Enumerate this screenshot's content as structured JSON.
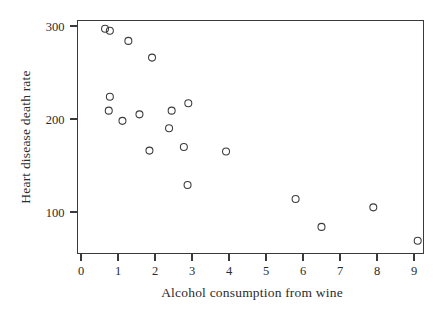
{
  "chart_data": {
    "type": "scatter",
    "title": "",
    "xlabel": "Alcohol consumption from wine",
    "ylabel": "Heart disease death rate",
    "xlim": [
      -0.12,
      9.25
    ],
    "ylim": [
      55,
      312
    ],
    "grid": false,
    "legend": null,
    "xticks": [
      0,
      1,
      2,
      3,
      4,
      5,
      6,
      7,
      8,
      9
    ],
    "xticklabels": [
      "0",
      "1",
      "2",
      "3",
      "4",
      "5",
      "6",
      "7",
      "8",
      "9"
    ],
    "yticks": [
      100,
      200,
      300
    ],
    "yticklabels": [
      "100",
      "200",
      "300"
    ],
    "marker": "open-circle",
    "marker_color": "#3b3b3b",
    "points": [
      {
        "x": 0.65,
        "y": 297
      },
      {
        "x": 0.78,
        "y": 295
      },
      {
        "x": 1.28,
        "y": 284
      },
      {
        "x": 1.92,
        "y": 266
      },
      {
        "x": 0.78,
        "y": 224
      },
      {
        "x": 0.75,
        "y": 209
      },
      {
        "x": 1.12,
        "y": 198
      },
      {
        "x": 1.58,
        "y": 205
      },
      {
        "x": 2.45,
        "y": 209
      },
      {
        "x": 2.9,
        "y": 217
      },
      {
        "x": 2.38,
        "y": 190
      },
      {
        "x": 1.85,
        "y": 166
      },
      {
        "x": 2.78,
        "y": 170
      },
      {
        "x": 3.92,
        "y": 165
      },
      {
        "x": 2.88,
        "y": 129
      },
      {
        "x": 5.8,
        "y": 114
      },
      {
        "x": 6.5,
        "y": 84
      },
      {
        "x": 7.9,
        "y": 105
      },
      {
        "x": 9.1,
        "y": 69
      }
    ]
  },
  "axes": {
    "y_axis_title": "Heart disease death rate",
    "x_axis_title": "Alcohol consumption from wine"
  },
  "colors": {
    "axis": "#3a3a3a",
    "marker": "#3b3b3b",
    "text": "#2b2b2b",
    "background": "#ffffff"
  }
}
